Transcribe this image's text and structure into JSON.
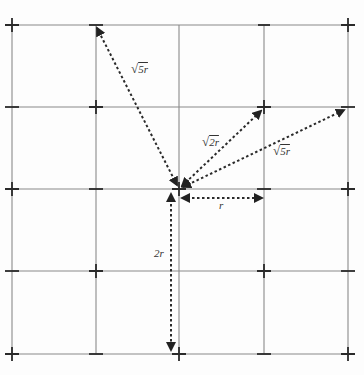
{
  "diagram": {
    "type": "square lattice neighbor distances",
    "grid": {
      "x": [
        12,
        96,
        179,
        264,
        348
      ],
      "y": [
        25,
        107,
        189,
        271,
        354
      ],
      "marks": [
        [
          "+",
          "-",
          "-",
          "-",
          "+"
        ],
        [
          "-",
          "+",
          "-",
          "+",
          "-"
        ],
        [
          "+",
          "-",
          "+",
          "-",
          "+"
        ],
        [
          "-",
          "+",
          " ",
          "+",
          "-"
        ],
        [
          "+",
          "-",
          "+",
          "-",
          "+"
        ]
      ]
    },
    "origin": {
      "x": 179,
      "y": 189
    },
    "vectors": [
      {
        "id": "r",
        "label": "r",
        "from": [
          181,
          198
        ],
        "to": [
          263,
          198
        ]
      },
      {
        "id": "2r",
        "label": "2r",
        "from": [
          171,
          192
        ],
        "to": [
          171,
          350
        ]
      },
      {
        "id": "sqrt2r",
        "label": "√2r",
        "from": [
          181,
          186
        ],
        "to": [
          262,
          110
        ]
      },
      {
        "id": "sqrt5r-upper",
        "label": "√5r",
        "from": [
          177,
          186
        ],
        "to": [
          96,
          28
        ]
      },
      {
        "id": "sqrt5r-right",
        "label": "√5r",
        "from": [
          182,
          187
        ],
        "to": [
          345,
          109
        ]
      }
    ]
  },
  "labels": {
    "r": "r",
    "two_r": "2r",
    "sqrt_symbol": "√",
    "sqrt2_value": "2r",
    "sqrt5_upper_value": "5r",
    "sqrt5_right_value": "5r"
  }
}
